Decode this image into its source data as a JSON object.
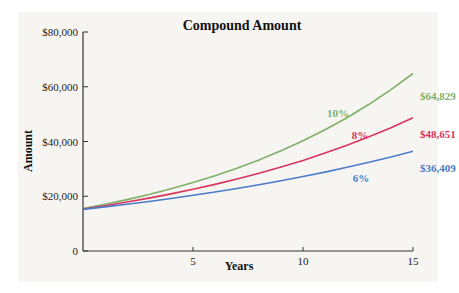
{
  "chart_data": {
    "type": "line",
    "title": "Compound Amount",
    "xlabel": "Years",
    "ylabel": "Amount",
    "xlim": [
      0,
      15
    ],
    "ylim": [
      0,
      80000
    ],
    "x_ticks": [
      {
        "value": 5,
        "label": "5"
      },
      {
        "value": 10,
        "label": "10"
      },
      {
        "value": 15,
        "label": "15"
      }
    ],
    "y_ticks": [
      {
        "value": 0,
        "label": "0"
      },
      {
        "value": 20000,
        "label": "$20,000"
      },
      {
        "value": 40000,
        "label": "$40,000"
      },
      {
        "value": 60000,
        "label": "$60,000"
      },
      {
        "value": 80000,
        "label": "$80,000"
      }
    ],
    "grid": false,
    "legend": "inline labels",
    "x": [
      0,
      1,
      2,
      3,
      4,
      5,
      6,
      7,
      8,
      9,
      10,
      11,
      12,
      13,
      14,
      15
    ],
    "series": [
      {
        "name": "10%",
        "rate": 0.1,
        "color": "#7fb069",
        "end_label": "$64,829",
        "values": [
          15520,
          17072,
          18779,
          20657,
          22723,
          24995,
          27495,
          30244,
          33269,
          36596,
          40255,
          44281,
          48709,
          53580,
          58938,
          64829
        ]
      },
      {
        "name": "8%",
        "rate": 0.08,
        "color": "#d9345e",
        "end_label": "$48,651",
        "values": [
          15337,
          16564,
          17889,
          19320,
          20866,
          22535,
          24338,
          26285,
          28388,
          30659,
          33111,
          35760,
          38621,
          41711,
          45047,
          48651
        ]
      },
      {
        "name": "6%",
        "rate": 0.06,
        "color": "#4a7cc9",
        "end_label": "$36,409",
        "values": [
          15192,
          16104,
          17070,
          18094,
          19180,
          20331,
          21550,
          22843,
          24214,
          25667,
          27207,
          28839,
          30570,
          32404,
          34348,
          36409
        ]
      }
    ]
  }
}
